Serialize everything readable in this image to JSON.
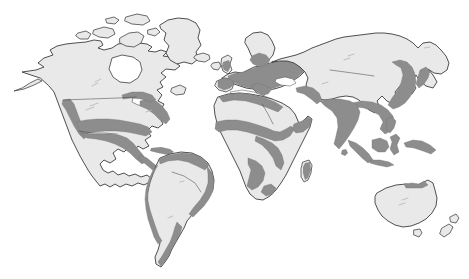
{
  "figure": {
    "type": "world-map",
    "background_color": "#ffffff",
    "width": 469,
    "height": 279,
    "has_text_labels": false,
    "has_legend": false,
    "has_border": false,
    "projection_style": "equirectangular-like world outline"
  },
  "style": {
    "land_fill": "#e9e9e9",
    "land_outline": "#3c3c3c",
    "shaded_fill": "#8d8d8d",
    "shaded_outline": "#6f6f6f",
    "internal_border": "#4a4a4a",
    "ocean_fill": "#ffffff"
  },
  "legend_meaning": {
    "light_gray": "Unshaded landmass",
    "dark_gray": "Shaded / highlighted region"
  },
  "continents": [
    {
      "name": "North America",
      "shaded": "partial",
      "shaded_areas": [
        "United States west coast",
        "United States east coast",
        "Southern United States",
        "Mexico",
        "Central America",
        "Caribbean"
      ],
      "unshaded_areas": [
        "Canada",
        "Alaska interior",
        "Greenland",
        "Canadian Arctic Archipelago",
        "United States midwest"
      ]
    },
    {
      "name": "South America",
      "shaded": "partial",
      "shaded_areas": [
        "Northern coast",
        "Andes west coast",
        "Brazilian east coast",
        "Southern Argentina coast"
      ],
      "unshaded_areas": [
        "Amazon basin interior",
        "Patagonia interior"
      ]
    },
    {
      "name": "Europe",
      "shaded": "mostly",
      "shaded_areas": [
        "Western Europe",
        "Central Europe",
        "Eastern Europe",
        "Southern Scandinavia",
        "Mediterranean coast",
        "British Isles coast"
      ],
      "unshaded_areas": [
        "Northern Scandinavia",
        "Iceland",
        "Iberian interior"
      ]
    },
    {
      "name": "Africa",
      "shaded": "partial",
      "shaded_areas": [
        "North African Mediterranean coast",
        "Sahel band",
        "West African coast",
        "Central Africa",
        "East Africa",
        "Southern Africa patches",
        "Madagascar east"
      ],
      "unshaded_areas": [
        "Sahara Desert",
        "Congo interior",
        "Southern Africa interior"
      ]
    },
    {
      "name": "Asia",
      "shaded": "partial",
      "shaded_areas": [
        "Indian subcontinent",
        "Southeast Asia",
        "Eastern China",
        "Korean Peninsula",
        "Japan",
        "Indonesia",
        "Philippines",
        "Middle East coast"
      ],
      "unshaded_areas": [
        "Siberia",
        "Central Asia",
        "Tibetan Plateau",
        "Western China",
        "Arabian interior"
      ]
    },
    {
      "name": "Oceania",
      "shaded": "minimal",
      "shaded_areas": [
        "New Guinea north coast",
        "Indonesian islands"
      ],
      "unshaded_areas": [
        "Australia",
        "New Zealand",
        "Tasmania"
      ]
    }
  ]
}
